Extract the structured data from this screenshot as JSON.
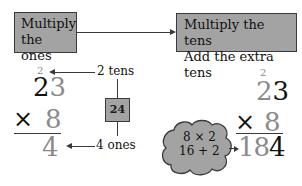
{
  "steps": {
    "step1": {
      "line1": "Multiply",
      "line2": "the ones"
    },
    "step2": {
      "line1": "Multiply the tens",
      "line2": "Add the extra tens"
    }
  },
  "left_problem": {
    "carry": "2",
    "top_tens": "2",
    "top_ones": "3",
    "operator": "×",
    "multiplier": "8",
    "result": "4"
  },
  "annotations": {
    "tens_label": "2 tens",
    "ones_label": "4 ones",
    "product_box": "24"
  },
  "right_problem": {
    "carry": "2",
    "top_tens": "2",
    "top_ones": "3",
    "operator": "×",
    "multiplier": "8",
    "result_gray": "18",
    "result_black": "4"
  },
  "cloud": {
    "line1": "8 × 2",
    "line2": "16 + 2"
  },
  "colors": {
    "box_fill": "#a3a3a3",
    "border": "#3a3a3a",
    "gray_digit": "#8a8a8a",
    "black_digit": "#111111"
  }
}
